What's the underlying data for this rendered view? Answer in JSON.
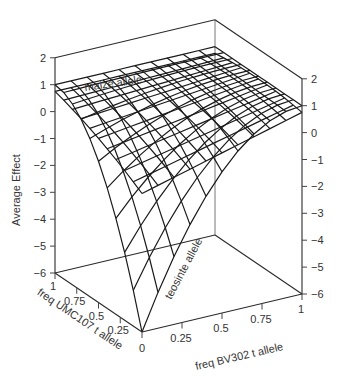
{
  "chart_data": {
    "type": "surface-3d-wireframe",
    "title": "",
    "zlabel": "Average Effect",
    "xlabel": "freq UMC107 t allele",
    "ylabel": "freq BV302 t allele",
    "x_ticks": [
      "1",
      "0.75",
      "0.5",
      "0.25",
      "0"
    ],
    "y_ticks": [
      "0",
      "0.25",
      "0.5",
      "0.75",
      "1"
    ],
    "z_ticks_left": [
      "2",
      "1",
      "0",
      "−1",
      "−2",
      "−3",
      "−4",
      "−5",
      "−6"
    ],
    "z_ticks_right": [
      "2",
      "1",
      "0",
      "−1",
      "−2",
      "−3",
      "−4",
      "−5",
      "−6"
    ],
    "zlim": [
      -6,
      2
    ],
    "xlim": [
      0,
      1
    ],
    "ylim": [
      0,
      1
    ],
    "annotations": [
      {
        "text": "maize allele",
        "position": "top-left of surface"
      },
      {
        "text": "teosinte allele",
        "position": "front edge along BV302 axis"
      }
    ],
    "grid_resolution": 11,
    "surfaces": [
      {
        "name": "main",
        "formula": "z = 1 - 7*(1-u)^2*(1-v)^2",
        "corner_values": {
          "u0v0": -6,
          "u1v0": 1,
          "u0v1": 1,
          "u1v1": 1
        }
      },
      {
        "name": "upper",
        "formula": "z = 0.9 - 1.6*(1-u)*(1-v) - 0.6*(u-0.5)^2",
        "corner_values": {
          "u0v0": -0.85,
          "u1v0": 0.75,
          "u0v1": 0.75,
          "u1v1": 0.75
        }
      }
    ]
  },
  "labels": {
    "zlabel": "Average Effect",
    "xlabel": "freq UMC107 t allele",
    "ylabel": "freq BV302 t allele",
    "maize": "maize allele",
    "teosinte": "teosinte allele"
  }
}
